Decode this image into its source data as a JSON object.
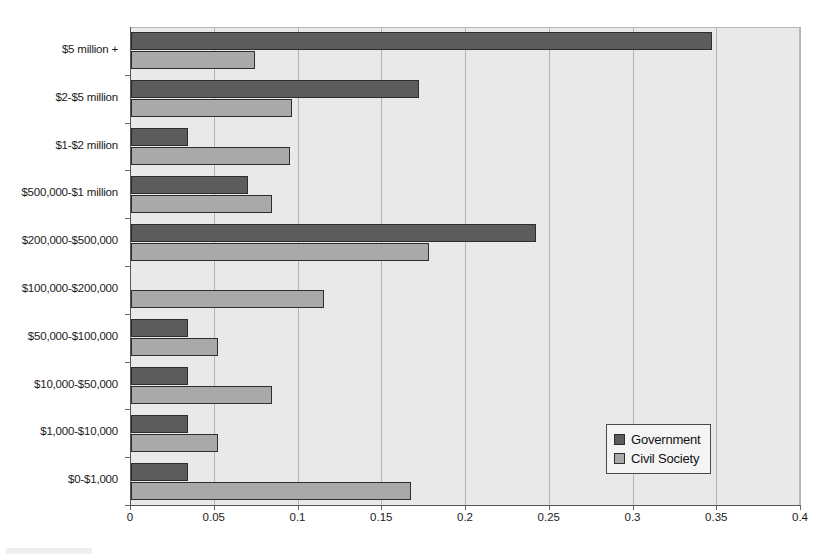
{
  "chart_data": {
    "type": "bar",
    "orientation": "horizontal",
    "title": "",
    "xlabel": "",
    "ylabel": "",
    "xlim": [
      0,
      0.4
    ],
    "xticks": [
      "0",
      "0.05",
      "0.1",
      "0.15",
      "0.2",
      "0.25",
      "0.3",
      "0.35",
      "0.4"
    ],
    "xtick_values": [
      0,
      0.05,
      0.1,
      0.15,
      0.2,
      0.25,
      0.3,
      0.35,
      0.4
    ],
    "grid": true,
    "grid_axis": "x",
    "legend_position": "bottom-right",
    "categories": [
      "$5 million +",
      "$2-$5 million",
      "$1-$2 million",
      "$500,000-$1 million",
      "$200,000-$500,000",
      "$100,000-$200,000",
      "$50,000-$100,000",
      "$10,000-$50,000",
      "$1,000-$10,000",
      "$0-$1,000"
    ],
    "series": [
      {
        "name": "Government",
        "color": "#5c5c5c",
        "values": [
          0.347,
          0.172,
          0.034,
          0.07,
          0.242,
          0.0,
          0.034,
          0.034,
          0.034,
          0.034
        ]
      },
      {
        "name": "Civil Society",
        "color": "#a9a9a9",
        "values": [
          0.074,
          0.096,
          0.095,
          0.084,
          0.178,
          0.115,
          0.052,
          0.084,
          0.052,
          0.167
        ]
      }
    ],
    "plot_background": "#e9e9e9",
    "axis_color": "#555555"
  }
}
